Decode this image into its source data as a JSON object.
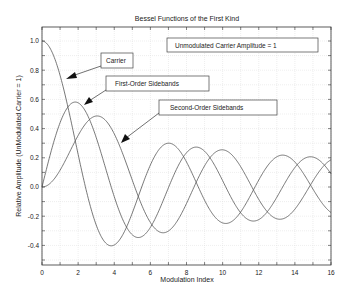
{
  "chart_data": {
    "type": "line",
    "title": "Bessel Functions of the First Kind",
    "xlabel": "Modulation Index",
    "ylabel": "Relative Amplitude (UnModulated Carrier = 1)",
    "xlim": [
      0,
      16
    ],
    "ylim": [
      -0.54,
      1.1
    ],
    "grid": true,
    "x_ticks": [
      0,
      2,
      4,
      6,
      8,
      10,
      12,
      14,
      16
    ],
    "x_tick_labels": [
      "0",
      "2",
      "4",
      "6",
      "8",
      "10",
      "12",
      "14",
      "16"
    ],
    "y_ticks": [
      -0.4,
      -0.2,
      0.0,
      0.2,
      0.4,
      0.6,
      0.8,
      1.0
    ],
    "y_tick_labels": [
      "-0.4",
      "-0.2",
      "0.0",
      "0.2",
      "0.4",
      "0.6",
      "0.8",
      "1.0"
    ],
    "x": [
      0,
      0.5,
      1,
      1.5,
      2,
      2.5,
      3,
      3.5,
      4,
      4.5,
      5,
      5.5,
      6,
      6.5,
      7,
      7.5,
      8,
      8.5,
      9,
      9.5,
      10,
      10.5,
      11,
      11.5,
      12,
      12.5,
      13,
      13.5,
      14,
      14.5,
      15,
      15.5,
      16
    ],
    "series": [
      {
        "name": "Carrier (J0)",
        "values": [
          1.0,
          0.9385,
          0.7652,
          0.5118,
          0.2239,
          -0.0484,
          -0.2601,
          -0.3801,
          -0.3971,
          -0.3205,
          -0.1776,
          -0.0068,
          0.1506,
          0.2601,
          0.3001,
          0.2663,
          0.1717,
          0.0419,
          -0.0903,
          -0.1939,
          -0.2459,
          -0.2366,
          -0.1712,
          -0.0677,
          0.0477,
          0.1469,
          0.2069,
          0.215,
          0.1711,
          0.0875,
          -0.0142,
          -0.1092,
          -0.1749
        ]
      },
      {
        "name": "First-Order Sidebands (J1)",
        "values": [
          0.0,
          0.2423,
          0.4401,
          0.5579,
          0.5767,
          0.4971,
          0.3391,
          0.1374,
          -0.066,
          -0.2311,
          -0.3276,
          -0.3414,
          -0.2767,
          -0.1538,
          -0.0047,
          0.1352,
          0.2346,
          0.2731,
          0.2453,
          0.1613,
          0.0435,
          -0.0789,
          -0.1768,
          -0.2284,
          -0.2234,
          -0.1655,
          -0.0703,
          0.038,
          0.1334,
          0.1934,
          0.2051,
          0.1672,
          0.0904
        ]
      },
      {
        "name": "Second-Order Sidebands (J2)",
        "values": [
          0.0,
          0.0306,
          0.1149,
          0.2321,
          0.3528,
          0.4461,
          0.4861,
          0.4586,
          0.3641,
          0.2178,
          0.0466,
          -0.1173,
          -0.2429,
          -0.3074,
          -0.3014,
          -0.23,
          -0.113,
          0.0223,
          0.1448,
          0.2279,
          0.2546,
          0.2215,
          0.139,
          0.0294,
          -0.0849,
          -0.1734,
          -0.2177,
          -0.2094,
          -0.152,
          -0.0608,
          0.0416,
          0.1307,
          0.1862
        ]
      }
    ],
    "annotations": [
      {
        "text": "Unmodulated Carrier Amplitude = 1",
        "box": true
      },
      {
        "text": "Carrier",
        "box": true,
        "arrow_to": [
          1.4,
          0.73
        ]
      },
      {
        "text": "First-Order Sidebands",
        "box": true,
        "arrow_to": [
          2.3,
          0.56
        ]
      },
      {
        "text": "Second-Order Sidebands",
        "box": true,
        "arrow_to": [
          4.4,
          0.3
        ]
      }
    ]
  },
  "colors": {
    "line": "#555555",
    "grid": "#dcdcdc",
    "axis": "#333333",
    "text": "#222222"
  }
}
